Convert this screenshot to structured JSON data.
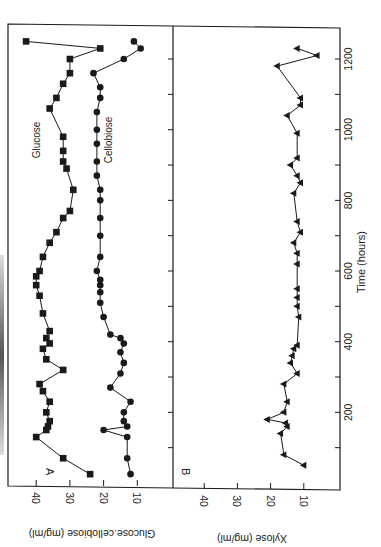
{
  "figure": {
    "orientation": "rotated-90-ccw",
    "colors": {
      "ink": "#1a1a1a",
      "background": "#ffffff"
    }
  },
  "chart_data": [
    {
      "panel": "A",
      "type": "line",
      "xlabel": "Time (hours)",
      "ylabel": "Glucose, cellobiose (mg/ml)",
      "xlim": [
        0,
        1260
      ],
      "ylim": [
        0,
        45
      ],
      "x_ticks": [
        200,
        400,
        600,
        800,
        1000,
        1200
      ],
      "x_minor_ticks": [
        100,
        300,
        500,
        700,
        900,
        1100
      ],
      "y_ticks": [
        10,
        20,
        30,
        40
      ],
      "grid": false,
      "legend": "inline labels",
      "series": [
        {
          "name": "Glucose",
          "marker": "square",
          "points": [
            [
              25,
              24
            ],
            [
              70,
              32
            ],
            [
              130,
              40
            ],
            [
              150,
              37
            ],
            [
              160,
              36.5
            ],
            [
              175,
              36
            ],
            [
              200,
              37
            ],
            [
              230,
              36
            ],
            [
              260,
              38
            ],
            [
              280,
              39
            ],
            [
              320,
              32
            ],
            [
              350,
              37
            ],
            [
              380,
              38
            ],
            [
              395,
              36
            ],
            [
              410,
              37
            ],
            [
              430,
              36
            ],
            [
              480,
              38
            ],
            [
              530,
              39
            ],
            [
              560,
              40
            ],
            [
              585,
              40
            ],
            [
              600,
              39
            ],
            [
              640,
              38
            ],
            [
              680,
              36
            ],
            [
              710,
              34
            ],
            [
              750,
              32
            ],
            [
              770,
              30
            ],
            [
              830,
              29
            ],
            [
              890,
              31
            ],
            [
              910,
              32
            ],
            [
              940,
              32
            ],
            [
              980,
              32
            ],
            [
              1060,
              36
            ],
            [
              1090,
              34
            ],
            [
              1130,
              32
            ],
            [
              1160,
              30
            ],
            [
              1200,
              30
            ],
            [
              1230,
              21
            ],
            [
              1250,
              43
            ]
          ]
        },
        {
          "name": "Cellobiose",
          "marker": "circle",
          "points": [
            [
              25,
              12
            ],
            [
              70,
              13
            ],
            [
              130,
              13
            ],
            [
              150,
              20
            ],
            [
              160,
              13
            ],
            [
              175,
              14
            ],
            [
              200,
              14
            ],
            [
              230,
              12
            ],
            [
              270,
              18
            ],
            [
              310,
              15
            ],
            [
              340,
              14
            ],
            [
              370,
              15
            ],
            [
              395,
              14
            ],
            [
              410,
              15
            ],
            [
              420,
              18
            ],
            [
              470,
              20
            ],
            [
              510,
              21
            ],
            [
              540,
              21
            ],
            [
              560,
              21
            ],
            [
              575,
              21
            ],
            [
              600,
              22
            ],
            [
              640,
              21
            ],
            [
              700,
              21
            ],
            [
              750,
              21
            ],
            [
              800,
              21
            ],
            [
              830,
              21
            ],
            [
              870,
              22
            ],
            [
              910,
              22
            ],
            [
              960,
              22
            ],
            [
              1000,
              22
            ],
            [
              1050,
              22
            ],
            [
              1090,
              21
            ],
            [
              1120,
              21
            ],
            [
              1160,
              23
            ],
            [
              1200,
              14
            ],
            [
              1230,
              9
            ],
            [
              1250,
              11
            ]
          ]
        }
      ],
      "annotations": [
        {
          "text": "A",
          "position": "panel corner"
        },
        {
          "text": "Glucose",
          "position": "near glucose series"
        },
        {
          "text": "Cellobiose",
          "position": "near cellobiose series"
        }
      ]
    },
    {
      "panel": "B",
      "type": "line",
      "xlabel": "Time (hours)",
      "ylabel": "Xylose (mg/ml)",
      "xlim": [
        0,
        1260
      ],
      "ylim": [
        0,
        45
      ],
      "x_ticks": [
        200,
        400,
        600,
        800,
        1000,
        1200
      ],
      "x_minor_ticks": [
        100,
        300,
        500,
        700,
        900,
        1100
      ],
      "y_ticks": [
        10,
        20,
        30,
        40
      ],
      "grid": false,
      "series": [
        {
          "name": "Xylose",
          "marker": "triangle",
          "points": [
            [
              50,
              10
            ],
            [
              80,
              16
            ],
            [
              140,
              17
            ],
            [
              160,
              15
            ],
            [
              170,
              15.5
            ],
            [
              180,
              21
            ],
            [
              200,
              16
            ],
            [
              230,
              15
            ],
            [
              280,
              16
            ],
            [
              310,
              12
            ],
            [
              340,
              14
            ],
            [
              360,
              13.5
            ],
            [
              380,
              13
            ],
            [
              390,
              12
            ],
            [
              470,
              11.5
            ],
            [
              500,
              12
            ],
            [
              525,
              12
            ],
            [
              550,
              12
            ],
            [
              620,
              12
            ],
            [
              650,
              12
            ],
            [
              680,
              13
            ],
            [
              710,
              11
            ],
            [
              740,
              12
            ],
            [
              820,
              13
            ],
            [
              850,
              11
            ],
            [
              870,
              12
            ],
            [
              900,
              14
            ],
            [
              920,
              12
            ],
            [
              990,
              12
            ],
            [
              1040,
              15
            ],
            [
              1070,
              11
            ],
            [
              1090,
              11
            ],
            [
              1180,
              18
            ],
            [
              1210,
              6
            ],
            [
              1230,
              12
            ]
          ]
        }
      ],
      "annotations": [
        {
          "text": "B",
          "position": "panel corner"
        }
      ]
    }
  ],
  "labels": {
    "panel_a": "A",
    "panel_b": "B",
    "glucose": "Glucose",
    "cellobiose": "Cellobiose",
    "y_label_a": "Glucose.cellobiose (mg/ml)",
    "y_label_b": "Xylose (mg/ml)",
    "x_label": "Time (hours)",
    "y_ticks": [
      "40",
      "30",
      "20",
      "10"
    ],
    "x_ticks": [
      "200",
      "400",
      "600",
      "800",
      "1000",
      "1200"
    ]
  }
}
